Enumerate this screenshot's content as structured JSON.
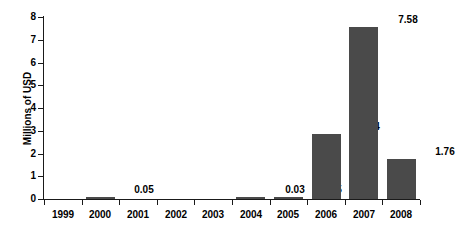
{
  "chart_data": {
    "type": "bar",
    "title": "",
    "subtitle": "",
    "xlabel": "",
    "ylabel": "Millions of USD",
    "categories": [
      "1999",
      "2000",
      "2001",
      "2002",
      "2003",
      "2004",
      "2005",
      "2006",
      "2007",
      "2008"
    ],
    "values": [
      0,
      0.05,
      0,
      0,
      0,
      0.03,
      0.05,
      2.84,
      7.58,
      1.76
    ],
    "data_labels": [
      "",
      "0.05",
      "",
      "",
      "",
      "0.03",
      "0.05",
      "2.84",
      "7.58",
      "1.76"
    ],
    "ylim": [
      0,
      8
    ],
    "y_ticks": [
      0,
      1,
      2,
      3,
      4,
      5,
      6,
      7,
      8
    ],
    "y_tick_labels": [
      "0",
      "1",
      "2",
      "3",
      "4",
      "5",
      "6",
      "7",
      "8"
    ],
    "grid": false,
    "legend": null,
    "bar_color": "#4a4a4a",
    "axis_color": "#1a1a1a",
    "background_color": "#ffffff"
  }
}
